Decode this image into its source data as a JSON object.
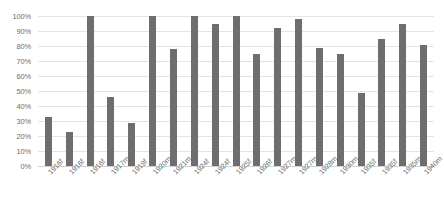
{
  "chart_data": {
    "type": "bar",
    "title": "",
    "xlabel": "",
    "ylabel": "",
    "ylim": [
      0,
      100
    ],
    "y_ticks": [
      "0%",
      "10%",
      "20%",
      "30%",
      "40%",
      "50%",
      "60%",
      "70%",
      "80%",
      "90%",
      "100%"
    ],
    "y_tick_values": [
      0,
      10,
      20,
      30,
      40,
      50,
      60,
      70,
      80,
      90,
      100
    ],
    "grid": true,
    "legend": "none",
    "bar_color": "#6e6e6e",
    "gridline_color": "#e4e4e4",
    "background_color": "#ffffff",
    "axis_text_color": "#6b6b6b",
    "categories": [
      "1916f",
      "1916f",
      "1916f",
      "1917m",
      "1919f",
      "1920m",
      "1921m",
      "1924f",
      "1924f",
      "1925f",
      "1926f",
      "1927m",
      "1927m",
      "1928m",
      "1930m",
      "1935f",
      "1935f",
      "1935m",
      "1940m"
    ],
    "values": [
      33,
      23,
      100,
      46,
      29,
      100,
      78,
      100,
      95,
      100,
      75,
      92,
      98,
      79,
      75,
      49,
      85,
      95,
      81
    ]
  }
}
